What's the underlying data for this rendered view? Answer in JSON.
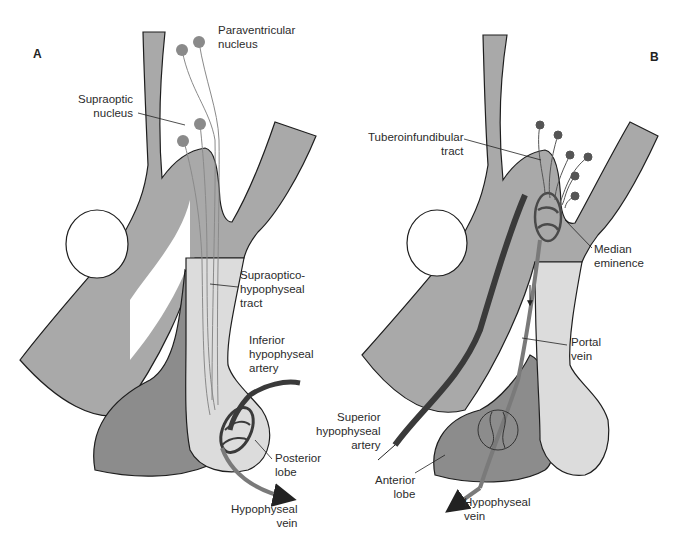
{
  "figure": {
    "panels": [
      {
        "id": "A",
        "letter": "A",
        "labels": {
          "paraventricular": "Paraventricular\nnucleus",
          "supraoptic": "Supraoptic\nnucleus",
          "tract": "Supraoptico-\nhypophyseal\ntract",
          "inferior_artery": "Inferior\nhypophyseal\nartery",
          "posterior_lobe": "Posterior\nlobe",
          "vein": "Hypophyseal\nvein"
        }
      },
      {
        "id": "B",
        "letter": "B",
        "labels": {
          "tuberoinfundibular": "Tuberoinfundibular\ntract",
          "median_eminence": "Median\neminence",
          "portal_vein": "Portal\nvein",
          "superior_artery": "Superior\nhypophyseal\nartery",
          "anterior_lobe": "Anterior\nlobe",
          "vein": "Hypophyseal\nvein"
        }
      }
    ],
    "colors": {
      "brain_tissue": "#a9a9a9",
      "posterior_lobe": "#dcdcdc",
      "anterior_lobe": "#8c8c8c",
      "outline": "#1e1e1e",
      "neuron": "#8a8a8a",
      "vessel_dark": "#3a3a3a",
      "vessel_mid": "#7a7a7a"
    }
  }
}
